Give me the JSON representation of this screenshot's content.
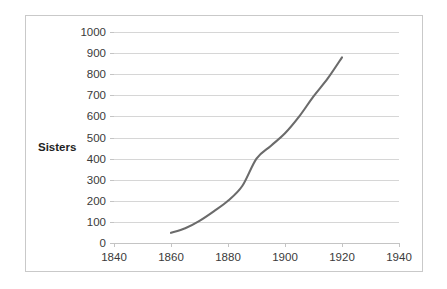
{
  "chart_data": {
    "type": "line",
    "title": "",
    "subtitle": "",
    "xlabel": "",
    "ylabel": "Sisters",
    "xlim": [
      1840,
      1940
    ],
    "ylim": [
      0,
      1000
    ],
    "grid": true,
    "legend": false,
    "legend_position": "none",
    "x_ticks": [
      1840,
      1860,
      1880,
      1900,
      1920,
      1940
    ],
    "y_ticks": [
      0,
      100,
      200,
      300,
      400,
      500,
      600,
      700,
      800,
      900,
      1000
    ],
    "series": [
      {
        "name": "Sisters",
        "color": "#6b6b6b",
        "x": [
          1860,
          1865,
          1870,
          1875,
          1880,
          1885,
          1890,
          1895,
          1900,
          1905,
          1910,
          1915,
          1920
        ],
        "values": [
          48,
          70,
          105,
          150,
          200,
          270,
          400,
          460,
          520,
          600,
          695,
          780,
          880
        ]
      }
    ],
    "annotations": []
  },
  "axis": {
    "y_title": "Sisters",
    "y_tick_labels": [
      "1000",
      "900",
      "800",
      "700",
      "600",
      "500",
      "400",
      "300",
      "200",
      "100",
      "0"
    ],
    "x_tick_labels": [
      "1840",
      "1860",
      "1880",
      "1900",
      "1920",
      "1940"
    ]
  },
  "style": {
    "line_color": "#6b6b6b",
    "grid_color": "#d6d6d6",
    "axis_color": "#c4c4c4",
    "border_color": "#c9c9c9",
    "background": "#ffffff",
    "tick_label_color": "#3a3a3a"
  }
}
